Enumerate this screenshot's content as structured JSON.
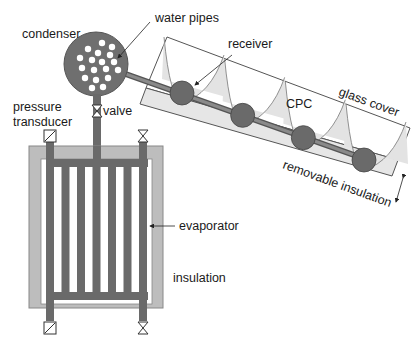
{
  "diagram": {
    "labels": {
      "condenser": "condenser",
      "water_pipes": "water pipes",
      "receiver": "receiver",
      "glass_cover": "glass cover",
      "cpc": "CPC",
      "removable_insulation": "removable insulation",
      "pressure": "pressure",
      "transducer": "transducer",
      "valve": "valve",
      "evaporator": "evaporator",
      "insulation": "insulation"
    },
    "components": {
      "receiver_count": 4,
      "cpc_reflector_count": 4,
      "water_pipe_holes": 18,
      "evaporator_vertical_tubes": 5,
      "valves": 3,
      "pressure_transducers": 2
    },
    "colors": {
      "pipe_dark": "#6a6a6a",
      "insulation_gray": "#b8b8b8",
      "cpc_fill": "#e3e3e3",
      "outline": "#555555",
      "text": "#1a1a1a"
    }
  }
}
